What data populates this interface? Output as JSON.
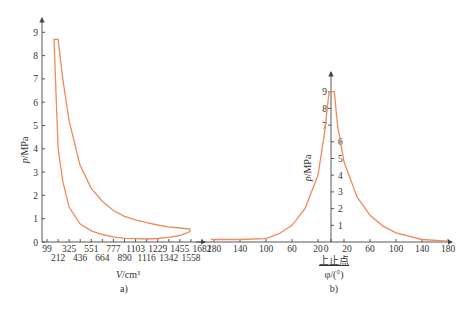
{
  "chart_data": [
    {
      "type": "line",
      "panel_label": "a)",
      "title": "",
      "xlabel": "V/cm³",
      "ylabel": "p/MPa",
      "x_tick_labels_row1": [
        "99",
        "325",
        "551",
        "777",
        "1103",
        "1229",
        "1455",
        "1682"
      ],
      "x_tick_labels_row2": [
        "212",
        "436",
        "664",
        "890",
        "1116",
        "1342",
        "1558"
      ],
      "y_ticks": [
        "0",
        "1",
        "2",
        "3",
        "4",
        "5",
        "6",
        "7",
        "8",
        "9"
      ],
      "ylim": [
        0,
        9.5
      ],
      "xlim": [
        0,
        1750
      ],
      "grid": false,
      "series": [
        {
          "name": "p-V indicator loop",
          "color": "#f08a5d",
          "points_upper": [
            [
              212,
              8.7
            ],
            [
              260,
              7.0
            ],
            [
              325,
              5.2
            ],
            [
              436,
              3.3
            ],
            [
              551,
              2.3
            ],
            [
              664,
              1.75
            ],
            [
              777,
              1.35
            ],
            [
              890,
              1.1
            ],
            [
              1003,
              0.95
            ],
            [
              1116,
              0.83
            ],
            [
              1229,
              0.73
            ],
            [
              1342,
              0.65
            ],
            [
              1455,
              0.6
            ],
            [
              1558,
              0.55
            ]
          ],
          "points_lower": [
            [
              1558,
              0.45
            ],
            [
              1455,
              0.28
            ],
            [
              1342,
              0.2
            ],
            [
              1229,
              0.15
            ],
            [
              1116,
              0.13
            ],
            [
              1003,
              0.14
            ],
            [
              890,
              0.16
            ],
            [
              777,
              0.22
            ],
            [
              664,
              0.32
            ],
            [
              551,
              0.48
            ],
            [
              436,
              0.78
            ],
            [
              325,
              1.5
            ],
            [
              260,
              2.6
            ],
            [
              212,
              4.0
            ],
            [
              170,
              8.7
            ]
          ]
        }
      ]
    },
    {
      "type": "line",
      "panel_label": "b)",
      "title": "",
      "xlabel": "φ/(°)",
      "x_annotation": "上止点",
      "ylabel": "p/MPa",
      "x_tick_labels": [
        "180",
        "140",
        "100",
        "60",
        "20",
        "0",
        "20",
        "60",
        "100",
        "140",
        "180"
      ],
      "y_ticks_left": [
        "7",
        "8",
        "9"
      ],
      "y_ticks_right": [
        "1",
        "2",
        "3",
        "4",
        "5",
        "6"
      ],
      "ylim": [
        0,
        9.5
      ],
      "xlim": [
        -190,
        190
      ],
      "grid": false,
      "series": [
        {
          "name": "p-φ pressure curve",
          "color": "#f08a5d",
          "points": [
            [
              -185,
              0.15
            ],
            [
              -140,
              0.15
            ],
            [
              -100,
              0.2
            ],
            [
              -80,
              0.5
            ],
            [
              -60,
              1.0
            ],
            [
              -40,
              2.0
            ],
            [
              -20,
              4.0
            ],
            [
              -10,
              6.5
            ],
            [
              -3,
              9.0
            ],
            [
              5,
              9.0
            ],
            [
              10,
              7.0
            ],
            [
              20,
              4.8
            ],
            [
              40,
              2.7
            ],
            [
              60,
              1.6
            ],
            [
              80,
              0.95
            ],
            [
              100,
              0.55
            ],
            [
              140,
              0.15
            ],
            [
              180,
              0.05
            ]
          ]
        }
      ]
    }
  ]
}
